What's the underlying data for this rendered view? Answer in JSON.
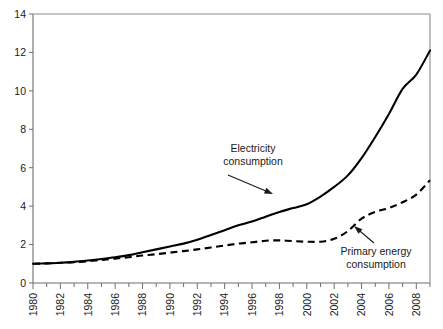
{
  "chart_data": {
    "type": "line",
    "title": "",
    "subtitle": "",
    "xlabel": "",
    "ylabel": "",
    "xlim": [
      1980,
      2009
    ],
    "ylim": [
      0,
      14
    ],
    "yticks": [
      0,
      2,
      4,
      6,
      8,
      10,
      12,
      14
    ],
    "ytick_labels": [
      "0",
      "2",
      "4",
      "6",
      "8",
      "10",
      "12",
      "14"
    ],
    "xticks": [
      1980,
      1982,
      1984,
      1986,
      1988,
      1990,
      1992,
      1994,
      1996,
      1998,
      2000,
      2002,
      2004,
      2006,
      2008
    ],
    "xtick_labels": [
      "1980",
      "1982",
      "1984",
      "1986",
      "1988",
      "1990",
      "1992",
      "1994",
      "1996",
      "1998",
      "2000",
      "2002",
      "2004",
      "2006",
      "2008"
    ],
    "xtick_rotation": -90,
    "minor_xticks_every": 1,
    "grid": false,
    "legend": "annotations",
    "x": [
      1980,
      1981,
      1982,
      1983,
      1984,
      1985,
      1986,
      1987,
      1988,
      1989,
      1990,
      1991,
      1992,
      1993,
      1994,
      1995,
      1996,
      1997,
      1998,
      1999,
      2000,
      2001,
      2002,
      2003,
      2004,
      2005,
      2006,
      2007,
      2008,
      2009
    ],
    "series": [
      {
        "name": "Electricity consumption",
        "style": "solid",
        "color": "#000000",
        "values": [
          1.0,
          1.02,
          1.05,
          1.1,
          1.17,
          1.25,
          1.34,
          1.45,
          1.6,
          1.75,
          1.9,
          2.05,
          2.25,
          2.5,
          2.75,
          3.0,
          3.2,
          3.45,
          3.7,
          3.9,
          4.1,
          4.5,
          5.0,
          5.6,
          6.5,
          7.6,
          8.8,
          10.1,
          10.85,
          12.1
        ]
      },
      {
        "name": "Primary energy consumption",
        "style": "dashed",
        "color": "#000000",
        "values": [
          1.0,
          1.02,
          1.05,
          1.08,
          1.13,
          1.2,
          1.27,
          1.34,
          1.43,
          1.5,
          1.58,
          1.66,
          1.75,
          1.85,
          1.95,
          2.05,
          2.12,
          2.2,
          2.22,
          2.18,
          2.15,
          2.15,
          2.3,
          2.7,
          3.35,
          3.7,
          3.9,
          4.2,
          4.6,
          5.35
        ]
      }
    ],
    "annotations": [
      {
        "id": "electricity",
        "label_line1": "Electricity",
        "label_line2": "consumption",
        "text_x": 253,
        "text_y": 152,
        "arrow_from_x": 228,
        "arrow_from_y": 175,
        "arrow_to_x": 273,
        "arrow_to_y": 194
      },
      {
        "id": "primary-energy",
        "label_line1": "Primary energy",
        "label_line2": "consumption",
        "text_x": 376,
        "text_y": 255,
        "arrow_from_x": 374,
        "arrow_from_y": 243,
        "arrow_to_x": 354,
        "arrow_to_y": 226
      }
    ]
  }
}
